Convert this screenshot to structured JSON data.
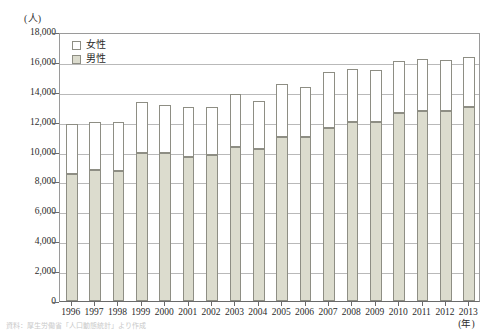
{
  "axis": {
    "unit_label": "(人)",
    "x_unit_label": "(年)",
    "y_ticks": [
      "18,000",
      "16,000",
      "14,000",
      "12,000",
      "10,000",
      "8,000",
      "6,000",
      "4,000",
      "2,000",
      "0"
    ]
  },
  "legend": {
    "items": [
      {
        "label": "女性",
        "color": "#ffffff"
      },
      {
        "label": "男性",
        "color": "#dcdcce"
      }
    ]
  },
  "footnote": {
    "text": "資料：厚生労働省「人口動態統計」より作成"
  },
  "chart_data": {
    "type": "bar",
    "subtype": "stacked",
    "title": "",
    "xlabel": "(年)",
    "ylabel": "(人)",
    "ylim": [
      0,
      18000
    ],
    "ytick_interval": 2000,
    "grid": true,
    "legend_position": "top-left",
    "categories": [
      "1996",
      "1997",
      "1998",
      "1999",
      "2000",
      "2001",
      "2002",
      "2003",
      "2004",
      "2005",
      "2006",
      "2007",
      "2008",
      "2009",
      "2010",
      "2011",
      "2012",
      "2013"
    ],
    "series": [
      {
        "name": "男性",
        "color": "#dcdcce",
        "values": [
          8500,
          8750,
          8700,
          9900,
          9900,
          9650,
          9750,
          10300,
          10150,
          11000,
          10950,
          11550,
          12000,
          11950,
          12600,
          12700,
          12700,
          12950
        ]
      },
      {
        "name": "女性",
        "color": "#ffffff",
        "values": [
          3350,
          3250,
          3300,
          3400,
          3250,
          3350,
          3250,
          3550,
          3250,
          3550,
          3400,
          3750,
          3500,
          3500,
          3450,
          3500,
          3400,
          3350
        ]
      }
    ],
    "totals": [
      11850,
      12000,
      12000,
      13300,
      13150,
      13000,
      13000,
      13850,
      13400,
      14550,
      14350,
      15300,
      15500,
      15450,
      16050,
      16200,
      16100,
      16300
    ]
  }
}
